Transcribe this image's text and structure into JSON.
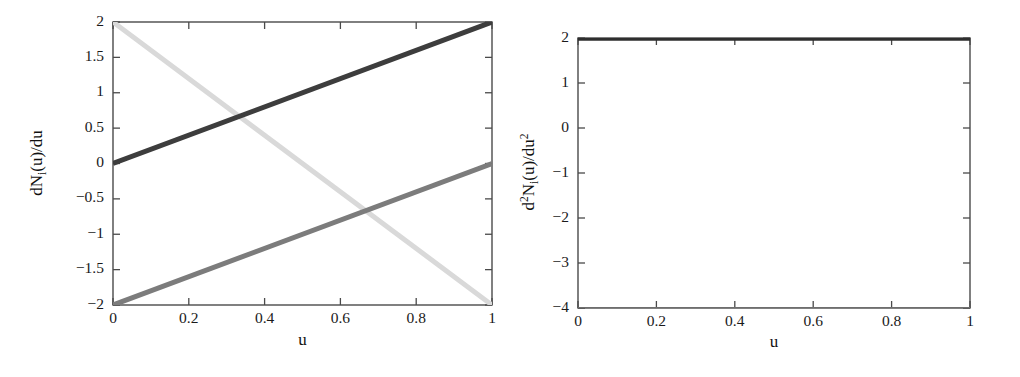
{
  "figure": {
    "background": "#ffffff",
    "panel_count": 2
  },
  "chart_data": [
    {
      "id": "left",
      "type": "line",
      "title": "",
      "subtitle": "",
      "xlabel": "u",
      "ylabel": "dNᵢ(u)/du",
      "ylabel_parts": {
        "pre": "dN",
        "sub": "i",
        "post": "(u)/du"
      },
      "xlim": [
        0,
        1
      ],
      "ylim": [
        -2,
        2
      ],
      "grid": false,
      "legend": "none",
      "xticks": [
        0,
        0.2,
        0.4,
        0.6,
        0.8,
        1
      ],
      "xticklabels": [
        "0",
        "0.2",
        "0.4",
        "0.6",
        "0.8",
        "1"
      ],
      "yticks": [
        -2,
        -1.5,
        -1,
        -0.5,
        0,
        0.5,
        1,
        1.5,
        2
      ],
      "yticklabels": [
        "−2",
        "−1.5",
        "−1",
        "−0.5",
        "0",
        "0.5",
        "1",
        "1.5",
        "2"
      ],
      "series": [
        {
          "name": "dN₁(u)/du",
          "color": "#d9d9d9",
          "linewidth": 5,
          "x": [
            0,
            1
          ],
          "values": [
            2,
            -2
          ]
        },
        {
          "name": "dN₂(u)/du",
          "color": "#3d3d3d",
          "linewidth": 5,
          "x": [
            0,
            1
          ],
          "values": [
            0,
            2
          ]
        },
        {
          "name": "dN₃(u)/du",
          "color": "#7c7c7c",
          "linewidth": 5,
          "x": [
            0,
            1
          ],
          "values": [
            -2,
            0
          ]
        }
      ]
    },
    {
      "id": "right",
      "type": "line",
      "title": "",
      "subtitle": "",
      "xlabel": "u",
      "ylabel": "d²Nᵢ(u)/du²",
      "ylabel_parts": {
        "pre": "d",
        "sup1": "2",
        "mid": "N",
        "sub": "i",
        "post": "(u)/du",
        "sup2": "2"
      },
      "xlim": [
        0,
        1
      ],
      "ylim": [
        -4,
        2
      ],
      "grid": false,
      "legend": "none",
      "xticks": [
        0,
        0.2,
        0.4,
        0.6,
        0.8,
        1
      ],
      "xticklabels": [
        "0",
        "0.2",
        "0.4",
        "0.6",
        "0.8",
        "1"
      ],
      "yticks": [
        -4,
        -3,
        -2,
        -1,
        0,
        1,
        2
      ],
      "yticklabels": [
        "−4",
        "−3",
        "−2",
        "−1",
        "0",
        "1",
        "2"
      ],
      "series": [
        {
          "name": "d²N₁(u)/du²",
          "color": "#2e2e2e",
          "linewidth": 5,
          "x": [
            0,
            1
          ],
          "values": [
            2,
            2
          ]
        },
        {
          "name": "d²N₂(u)/du²",
          "color": "#6e6e6e",
          "linewidth": 2,
          "x": [
            0,
            1
          ],
          "values": [
            -4,
            -4
          ]
        },
        {
          "name": "d²N₃(u)/du²",
          "color": "#2e2e2e",
          "linewidth": 5,
          "x": [
            0,
            1
          ],
          "values": [
            2,
            2
          ]
        }
      ]
    }
  ],
  "axes_style": {
    "spine_color": "#4a4a4a",
    "tick_color": "#4a4a4a",
    "text_color": "#1a1a1a"
  }
}
